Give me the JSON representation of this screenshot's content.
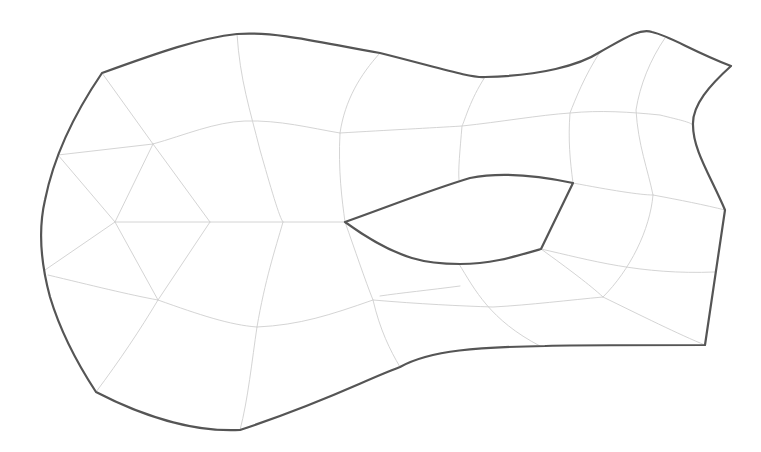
{
  "diagram": {
    "type": "quad-dominant mesh of a planar region with one hole",
    "colors": {
      "background": "#ffffff",
      "boundary": "#555555",
      "mesh": "#cfcfcf"
    },
    "outer_boundary": "M 102 73 C 160 52, 200 38, 237 34 C 280 31, 330 45, 380 53 C 440 68, 470 78, 485 77 C 540 76, 580 65, 600 52 C 625 38, 640 28, 652 32 C 670 36, 690 50, 731 66 C 710 85, 692 105, 693 125 C 693 150, 710 175, 725 210 L 705 345 C 640 345, 550 345, 545 346 C 480 347, 430 350, 400 367 C 360 382, 330 400, 240 430 C 200 432, 150 420, 96 392 C 75 360, 60 330, 50 297 C 40 260, 38 230, 45 200 C 52 165, 70 120, 102 73 Z",
    "hole_boundary": "M 345 222 C 390 206, 430 190, 470 178 C 500 172, 540 176, 573 183 L 541 249 C 510 258, 490 264, 460 264 C 430 264, 400 262, 345 222 Z",
    "mesh_lines": [
      "M 102 73 L 153 144",
      "M 58 155 L 153 144",
      "M 153 144 C 185 135, 215 122, 245 121 C 280 120, 310 128, 340 133",
      "M 340 133 C 390 130, 430 128, 462 126 C 500 122, 540 115, 570 113 C 600 110, 630 112, 660 115 C 680 120, 690 122, 693 125",
      "M 237 34 C 240 80, 250 110, 260 150 C 270 185, 280 220, 283 222",
      "M 380 53 C 360 75, 345 100, 340 133 C 338 170, 342 200, 345 222",
      "M 485 77 C 470 100, 465 120, 462 126 C 460 150, 458 170, 459 180",
      "M 600 52 C 585 75, 575 100, 570 113 C 568 140, 570 160, 573 183",
      "M 665 38 C 650 60, 640 85, 636 110 C 638 145, 648 170, 653 195",
      "M 573 183 C 610 190, 640 195, 653 195 C 680 200, 705 205, 725 210",
      "M 58 155 L 115 222",
      "M 153 144 L 115 222",
      "M 153 144 L 210 222",
      "M 115 222 L 210 222 L 283 222 L 345 222",
      "M 45 270 L 115 222",
      "M 115 222 L 158 300",
      "M 210 222 L 158 300",
      "M 283 222 C 275 250, 265 280, 257 327",
      "M 48 275 C 90 285, 130 295, 158 300 C 200 315, 230 325, 257 327 C 300 325, 330 315, 373 300",
      "M 158 300 C 140 330, 120 360, 96 392",
      "M 257 327 C 252 360, 248 400, 240 430",
      "M 345 222 C 355 250, 365 280, 373 300 C 380 330, 390 350, 400 367",
      "M 373 300 C 420 304, 460 306, 493 307 C 530 305, 570 300, 603 297",
      "M 380 296 C 400 293, 430 290, 460 286",
      "M 459 264 C 475 290, 490 320, 540 346",
      "M 541 249 C 570 270, 590 285, 603 297 C 640 315, 680 335, 705 345",
      "M 653 195 C 650 230, 630 270, 603 297",
      "M 541 249 C 590 260, 640 275, 715 272"
    ]
  }
}
